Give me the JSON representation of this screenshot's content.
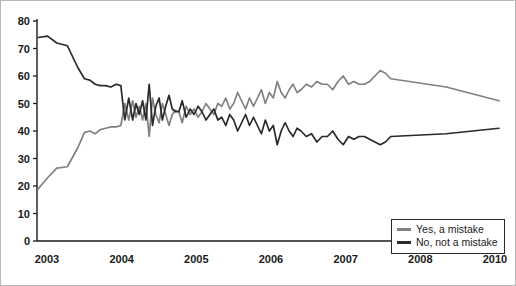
{
  "chart_data": {
    "type": "line",
    "title": "",
    "xlabel": "",
    "ylabel": "",
    "ylim": [
      0,
      80
    ],
    "yticks": [
      0,
      10,
      20,
      30,
      40,
      50,
      60,
      70,
      80
    ],
    "xtick_labels": [
      "2003",
      "2004",
      "2005",
      "2006",
      "2007",
      "2008",
      "2010"
    ],
    "xlim": [
      2003,
      2010
    ],
    "grid": false,
    "legend_position": "bottom-right",
    "legend": [
      "Yes, a mistake",
      "No, not a mistake"
    ],
    "series": [
      {
        "name": "Yes, a mistake",
        "color": "#808080",
        "x": [
          2003.02,
          2003.16,
          2003.3,
          2003.46,
          2003.62,
          2003.72,
          2003.8,
          2003.88,
          2003.96,
          2004.04,
          2004.12,
          2004.2,
          2004.27,
          2004.33,
          2004.39,
          2004.45,
          2004.5,
          2004.55,
          2004.6,
          2004.65,
          2004.7,
          2004.75,
          2004.8,
          2004.85,
          2004.9,
          2004.95,
          2005.0,
          2005.05,
          2005.1,
          2005.15,
          2005.2,
          2005.26,
          2005.32,
          2005.38,
          2005.44,
          2005.5,
          2005.56,
          2005.62,
          2005.68,
          2005.74,
          2005.8,
          2005.86,
          2005.92,
          2005.98,
          2006.04,
          2006.1,
          2006.16,
          2006.22,
          2006.28,
          2006.34,
          2006.4,
          2006.46,
          2006.52,
          2006.58,
          2006.64,
          2006.7,
          2006.76,
          2006.82,
          2006.88,
          2006.94,
          2007.0,
          2007.08,
          2007.16,
          2007.24,
          2007.32,
          2007.4,
          2007.48,
          2007.56,
          2007.64,
          2007.72,
          2007.8,
          2007.88,
          2007.96,
          2008.04,
          2008.12,
          2008.2,
          2008.28,
          2008.36,
          2009.2,
          2010.0
        ],
        "y": [
          19,
          23,
          26.5,
          27,
          34,
          39.5,
          40,
          39,
          40.5,
          41,
          41.5,
          41.5,
          42,
          50,
          44,
          51,
          45,
          49,
          44,
          50,
          38,
          52,
          46,
          43,
          50,
          46,
          42,
          46,
          47.5,
          47,
          43,
          49,
          46,
          48,
          45,
          47,
          50,
          48,
          46,
          50,
          49,
          52,
          48,
          50,
          54,
          51,
          48,
          52,
          49,
          52,
          55,
          50,
          54,
          52,
          58,
          54,
          52,
          55,
          57,
          54,
          55,
          57,
          56,
          58,
          57,
          57,
          55,
          58,
          60,
          57,
          58,
          57,
          57,
          58,
          60,
          62,
          61,
          59,
          56,
          51
        ]
      },
      {
        "name": "No, not a mistake",
        "color": "#2a2a2a",
        "x": [
          2003.02,
          2003.16,
          2003.3,
          2003.46,
          2003.62,
          2003.72,
          2003.8,
          2003.88,
          2003.96,
          2004.04,
          2004.12,
          2004.2,
          2004.27,
          2004.33,
          2004.39,
          2004.45,
          2004.5,
          2004.55,
          2004.6,
          2004.65,
          2004.7,
          2004.75,
          2004.8,
          2004.85,
          2004.9,
          2004.95,
          2005.0,
          2005.05,
          2005.1,
          2005.15,
          2005.2,
          2005.26,
          2005.32,
          2005.38,
          2005.44,
          2005.5,
          2005.56,
          2005.62,
          2005.68,
          2005.74,
          2005.8,
          2005.86,
          2005.92,
          2005.98,
          2006.04,
          2006.1,
          2006.16,
          2006.22,
          2006.28,
          2006.34,
          2006.4,
          2006.46,
          2006.52,
          2006.58,
          2006.64,
          2006.7,
          2006.76,
          2006.82,
          2006.88,
          2006.94,
          2007.0,
          2007.08,
          2007.16,
          2007.24,
          2007.32,
          2007.4,
          2007.48,
          2007.56,
          2007.64,
          2007.72,
          2007.8,
          2007.88,
          2007.96,
          2008.04,
          2008.12,
          2008.2,
          2008.28,
          2008.36,
          2009.2,
          2010.0
        ],
        "y": [
          74,
          74.5,
          72,
          71,
          63,
          59,
          58.5,
          57,
          56.5,
          56.5,
          56,
          57,
          56.5,
          44,
          52,
          44,
          50,
          46,
          51,
          44,
          57,
          42,
          49,
          52,
          44,
          49,
          53,
          48,
          47,
          47,
          51,
          45,
          48,
          46,
          49,
          47,
          44,
          46,
          48,
          44,
          45,
          42,
          46,
          44,
          40,
          43,
          46,
          42,
          45,
          42,
          39,
          44,
          40,
          42,
          35,
          40,
          43,
          40,
          38,
          41,
          40,
          38,
          39,
          36,
          38,
          38,
          40,
          37,
          35,
          38,
          37,
          38,
          38,
          37,
          36,
          35,
          36,
          38,
          39,
          41
        ]
      }
    ]
  },
  "legend": {
    "items": [
      {
        "label": "Yes, a mistake",
        "color": "#808080"
      },
      {
        "label": "No, not a mistake",
        "color": "#2a2a2a"
      }
    ]
  }
}
